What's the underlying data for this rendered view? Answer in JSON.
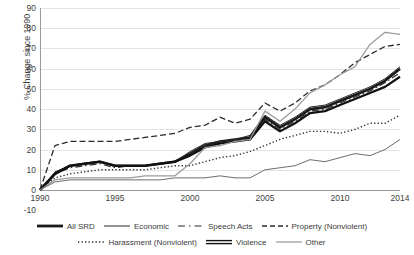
{
  "chart_data": {
    "type": "line",
    "title": "",
    "xlabel": "",
    "ylabel": "% Change since 1990",
    "xlim": [
      1990,
      2014
    ],
    "ylim": [
      -10,
      90
    ],
    "ytick_values": [
      90,
      80,
      70,
      60,
      50,
      40,
      30,
      20,
      10,
      0,
      -10
    ],
    "ytick_labels": [
      "90",
      "80",
      "70",
      "60",
      "50",
      "40",
      "30",
      "20",
      "10",
      "0",
      "-10"
    ],
    "xtick_values": [
      1990,
      1995,
      2000,
      2005,
      2010,
      2014
    ],
    "xtick_labels": [
      "1990",
      "1995",
      "2000",
      "2005",
      "2010",
      "2014"
    ],
    "grid": "horizontal",
    "legend_position": "bottom",
    "x": [
      1990,
      1991,
      1992,
      1993,
      1994,
      1995,
      1996,
      1997,
      1998,
      1999,
      2000,
      2001,
      2002,
      2003,
      2004,
      2005,
      2006,
      2007,
      2008,
      2009,
      2010,
      2011,
      2012,
      2013,
      2014
    ],
    "series": [
      {
        "name": "All SRD",
        "style": "solid",
        "width": 2.6,
        "color": "#1a1a1a",
        "values": [
          0,
          8,
          12,
          13,
          14,
          12,
          12,
          12,
          13,
          14,
          18,
          22,
          24,
          25,
          26,
          36,
          31,
          35,
          40,
          41,
          44,
          47,
          50,
          54,
          60
        ]
      },
      {
        "name": "Economic",
        "style": "solid",
        "width": 1.0,
        "color": "#2b2b2b",
        "values": [
          0,
          9,
          12,
          13,
          14,
          12,
          12,
          12,
          13,
          14,
          19,
          23,
          24,
          25,
          27,
          37,
          32,
          36,
          41,
          42,
          45,
          48,
          51,
          55,
          61
        ]
      },
      {
        "name": "Speech Acts",
        "style": "dashdot",
        "width": 1.2,
        "color": "#2b2b2b",
        "values": [
          0,
          8,
          11,
          12,
          13,
          11,
          12,
          12,
          13,
          14,
          18,
          22,
          23,
          24,
          25,
          35,
          30,
          34,
          39,
          40,
          43,
          46,
          49,
          53,
          58
        ]
      },
      {
        "name": "Property (Nonviolent)",
        "style": "dashed",
        "width": 1.3,
        "color": "#2b2b2b",
        "values": [
          0,
          22,
          24,
          24,
          24,
          24,
          25,
          26,
          27,
          28,
          31,
          32,
          36,
          33,
          35,
          43,
          39,
          43,
          49,
          52,
          57,
          63,
          67,
          71,
          72
        ]
      },
      {
        "name": "Harassment (Nonviolent)",
        "style": "dotted",
        "width": 1.4,
        "color": "#2b2b2b",
        "values": [
          0,
          6,
          8,
          9,
          10,
          10,
          10,
          10,
          11,
          12,
          12,
          14,
          16,
          17,
          19,
          22,
          25,
          27,
          29,
          29,
          28,
          30,
          33,
          33,
          37
        ]
      },
      {
        "name": "Violence",
        "style": "solid",
        "width": 2.2,
        "color": "#111111",
        "values": [
          0,
          8,
          12,
          13,
          14,
          12,
          12,
          12,
          13,
          14,
          17,
          21,
          23,
          24,
          25,
          34,
          29,
          33,
          38,
          39,
          42,
          45,
          48,
          51,
          56
        ]
      },
      {
        "name": "Other",
        "style": "solid",
        "width": 1.3,
        "color": "#9c9c9c",
        "values": [
          0,
          5,
          6,
          6,
          6,
          6,
          6,
          7,
          7,
          7,
          13,
          21,
          22,
          24,
          25,
          39,
          34,
          40,
          48,
          52,
          57,
          61,
          72,
          78,
          77
        ]
      },
      {
        "name": "Other (low)",
        "style": "solid",
        "width": 1.0,
        "color": "#6e6e6e",
        "values": [
          0,
          4,
          5,
          5,
          5,
          5,
          5,
          5,
          5,
          6,
          6,
          6,
          7,
          6,
          6,
          10,
          11,
          12,
          15,
          14,
          16,
          18,
          17,
          20,
          25
        ]
      }
    ]
  },
  "legend": {
    "rows": [
      [
        {
          "label": "All SRD",
          "swatch": "solid-thick"
        },
        {
          "label": "Economic",
          "swatch": "solid-thin"
        },
        {
          "label": "Speech Acts",
          "swatch": "dashdot"
        },
        {
          "label": "Property (Nonviolent)",
          "swatch": "dashed"
        }
      ],
      [
        {
          "label": "Harassment (Nonviolent)",
          "swatch": "dotted"
        },
        {
          "label": "Violence",
          "swatch": "solid-double"
        },
        {
          "label": "Other",
          "swatch": "solid-gray"
        }
      ]
    ]
  }
}
